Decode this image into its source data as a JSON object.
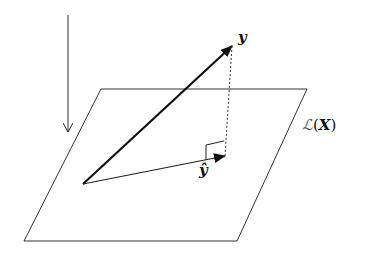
{
  "diagram": {
    "labels": {
      "y": "y",
      "y_hat": "ŷ",
      "space_script": "ℒ",
      "space_open": "(",
      "space_arg": "X",
      "space_close": ")"
    },
    "plane": {
      "name": "column space L(X)",
      "corners": [
        [
          101,
          89
        ],
        [
          307,
          89
        ],
        [
          237,
          241
        ],
        [
          24,
          241
        ]
      ]
    },
    "vectors": {
      "origin": [
        83,
        184
      ],
      "y_tip": [
        232,
        46
      ],
      "y_hat_tip": [
        225,
        156
      ]
    },
    "projection_line": {
      "from": [
        232,
        46
      ],
      "to": [
        225,
        156
      ],
      "style": "dotted"
    },
    "down_arrow": {
      "from": [
        68,
        15
      ],
      "to": [
        68,
        132
      ]
    },
    "colors": {
      "stroke": "#222222",
      "background": "#ffffff"
    }
  }
}
